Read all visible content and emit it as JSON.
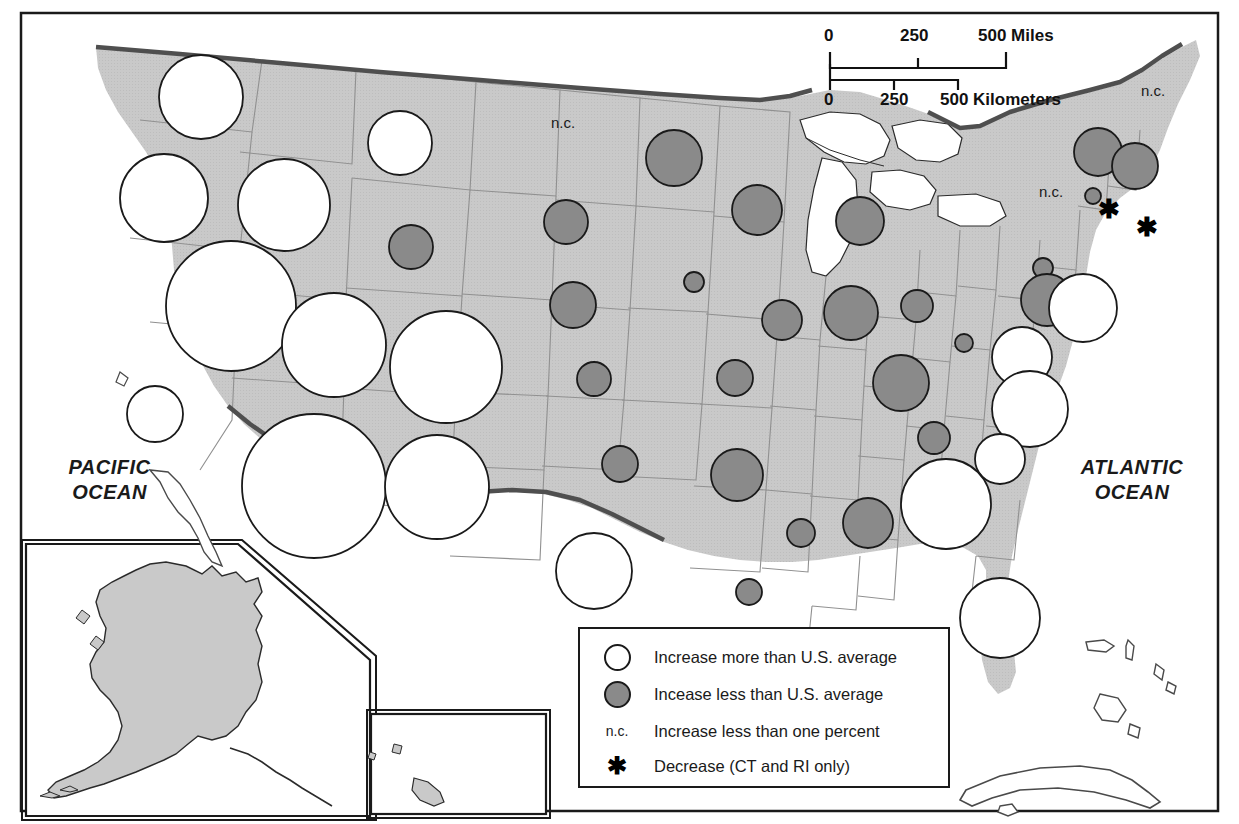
{
  "map": {
    "title": "Population change by state",
    "colors": {
      "land_fill": "#c9c9c9",
      "water_fill": "#ffffff",
      "state_border": "#8d8d8d",
      "national_border": "#4a4a4a",
      "circle_increase_more": "#ffffff",
      "circle_increase_less": "#8a8a8a",
      "outline": "#1a1a1a",
      "frame": "#1a1a1a"
    },
    "ocean_labels": [
      {
        "name": "pacific-ocean",
        "line1": "PACIFIC",
        "line2": "OCEAN",
        "x": 22,
        "y": 465
      },
      {
        "name": "atlantic-ocean",
        "line1": "ATLANTIC",
        "line2": "OCEAN",
        "x": 1062,
        "y": 465
      }
    ],
    "nc_labels": [
      {
        "name": "nc-label-north-dakota",
        "text": "n.c.",
        "x": 551,
        "y": 124
      },
      {
        "name": "nc-label-maine",
        "text": "n.c.",
        "x": 1141,
        "y": 92
      },
      {
        "name": "nc-label-pennsylvania",
        "text": "n.c.",
        "x": 1039,
        "y": 193
      }
    ],
    "star_labels": [
      {
        "name": "star-connecticut",
        "text": "✱",
        "x": 1106,
        "y": 205
      },
      {
        "name": "star-rhode-island",
        "text": "✱",
        "x": 1143,
        "y": 222
      }
    ]
  },
  "scalebar": {
    "miles": {
      "ticks": [
        "0",
        "250",
        "500 Miles"
      ]
    },
    "kilometers": {
      "ticks": [
        "0",
        "250",
        "500 Kilometers"
      ]
    }
  },
  "legend": {
    "rows": [
      {
        "symbol": "circle-open",
        "label": "Increase more than U.S. average"
      },
      {
        "symbol": "circle-filled",
        "label": "Incease less than U.S. average"
      },
      {
        "symbol": "nc",
        "symbol_text": "n.c.",
        "label": "Increase less than one percent"
      },
      {
        "symbol": "star",
        "symbol_text": "✱",
        "label": "Decrease (CT and RI only)"
      }
    ]
  },
  "chart_data": {
    "type": "map",
    "categories": [
      "Increase more than U.S. average",
      "Incease less than U.S. average",
      "Increase less than one percent",
      "Decrease (CT and RI only)"
    ],
    "symbols": [
      {
        "state": "WA",
        "class": "increase_more",
        "cx": 201,
        "cy": 97,
        "r": 42
      },
      {
        "state": "OR",
        "class": "increase_more",
        "cx": 164,
        "cy": 198,
        "r": 44
      },
      {
        "state": "ID",
        "class": "increase_more",
        "cx": 284,
        "cy": 205,
        "r": 46
      },
      {
        "state": "MT",
        "class": "increase_more",
        "cx": 400,
        "cy": 143,
        "r": 32
      },
      {
        "state": "ND",
        "class": "increase_less",
        "cx": 566,
        "cy": 222,
        "r": 22
      },
      {
        "state": "WY",
        "class": "increase_less",
        "cx": 411,
        "cy": 247,
        "r": 22
      },
      {
        "state": "NV",
        "class": "increase_more",
        "cx": 231,
        "cy": 306,
        "r": 65
      },
      {
        "state": "UT",
        "class": "increase_more",
        "cx": 334,
        "cy": 345,
        "r": 52
      },
      {
        "state": "CO",
        "class": "increase_more",
        "cx": 446,
        "cy": 367,
        "r": 56
      },
      {
        "state": "CA",
        "class": "increase_more",
        "cx": 314,
        "cy": 486,
        "r": 72
      },
      {
        "state": "AZ",
        "class": "increase_more",
        "cx": 155,
        "cy": 414,
        "r": 28
      },
      {
        "state": "NM",
        "class": "increase_more",
        "cx": 437,
        "cy": 487,
        "r": 52
      },
      {
        "state": "TX",
        "class": "increase_more",
        "cx": 594,
        "cy": 571,
        "r": 38
      },
      {
        "state": "SD",
        "class": "increase_less",
        "cx": 674,
        "cy": 158,
        "r": 28
      },
      {
        "state": "MN",
        "class": "increase_less",
        "cx": 757,
        "cy": 210,
        "r": 25
      },
      {
        "state": "WI",
        "class": "increase_less",
        "cx": 860,
        "cy": 221,
        "r": 24
      },
      {
        "state": "IA",
        "class": "increase_less",
        "cx": 694,
        "cy": 282,
        "r": 10
      },
      {
        "state": "NE",
        "class": "increase_less",
        "cx": 573,
        "cy": 305,
        "r": 23
      },
      {
        "state": "IL",
        "class": "increase_less",
        "cx": 782,
        "cy": 320,
        "r": 20
      },
      {
        "state": "IN",
        "class": "increase_less",
        "cx": 851,
        "cy": 313,
        "r": 27
      },
      {
        "state": "OH",
        "class": "increase_less",
        "cx": 917,
        "cy": 306,
        "r": 16
      },
      {
        "state": "KS",
        "class": "increase_less",
        "cx": 594,
        "cy": 379,
        "r": 17
      },
      {
        "state": "MO",
        "class": "increase_less",
        "cx": 735,
        "cy": 378,
        "r": 18
      },
      {
        "state": "KY",
        "class": "increase_less",
        "cx": 901,
        "cy": 383,
        "r": 28
      },
      {
        "state": "OK",
        "class": "increase_less",
        "cx": 620,
        "cy": 464,
        "r": 18
      },
      {
        "state": "AR",
        "class": "increase_less",
        "cx": 737,
        "cy": 475,
        "r": 26
      },
      {
        "state": "TN",
        "class": "increase_less",
        "cx": 934,
        "cy": 438,
        "r": 16
      },
      {
        "state": "LA",
        "class": "increase_less",
        "cx": 801,
        "cy": 533,
        "r": 14
      },
      {
        "state": "MS",
        "class": "increase_less",
        "cx": 868,
        "cy": 523,
        "r": 25
      },
      {
        "state": "AL",
        "class": "increase_less",
        "cx": 749,
        "cy": 592,
        "r": 13
      },
      {
        "state": "WV",
        "class": "increase_less",
        "cx": 964,
        "cy": 343,
        "r": 9
      },
      {
        "state": "PA",
        "class": "increase_less",
        "cx": 1043,
        "cy": 268,
        "r": 10
      },
      {
        "state": "NY-north",
        "class": "increase_less",
        "cx": 1098,
        "cy": 152,
        "r": 24
      },
      {
        "state": "VT-NH",
        "class": "increase_less",
        "cx": 1135,
        "cy": 166,
        "r": 23
      },
      {
        "state": "MA",
        "class": "increase_less",
        "cx": 1093,
        "cy": 196,
        "r": 8
      },
      {
        "state": "NJ-NY",
        "class": "increase_less",
        "cx": 1047,
        "cy": 300,
        "r": 26
      },
      {
        "state": "NC",
        "class": "increase_more",
        "cx": 1022,
        "cy": 357,
        "r": 30
      },
      {
        "state": "VA",
        "class": "increase_more",
        "cx": 1030,
        "cy": 409,
        "r": 38
      },
      {
        "state": "SC",
        "class": "increase_more",
        "cx": 1000,
        "cy": 459,
        "r": 25
      },
      {
        "state": "GA",
        "class": "increase_more",
        "cx": 946,
        "cy": 504,
        "r": 45
      },
      {
        "state": "MD-DE",
        "class": "increase_more",
        "cx": 1083,
        "cy": 308,
        "r": 34
      },
      {
        "state": "FL",
        "class": "increase_more",
        "cx": 1000,
        "cy": 618,
        "r": 40
      },
      {
        "state": "AK",
        "class": "increase_more",
        "cx": 189,
        "cy": 648,
        "r": 26
      },
      {
        "state": "HI",
        "class": "increase_less",
        "cx": 386,
        "cy": 762,
        "r": 19
      }
    ],
    "nc_states": [
      "ND",
      "ME",
      "PA"
    ],
    "decrease_states": [
      "CT",
      "RI"
    ]
  }
}
